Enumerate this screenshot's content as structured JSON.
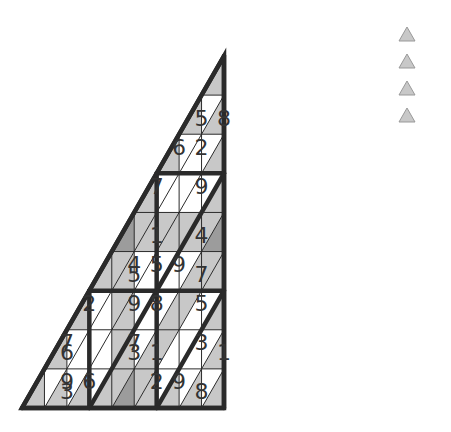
{
  "puzzle": {
    "type": "triangular-sudoku",
    "rows": 9,
    "geometry": {
      "apex_x": 224,
      "apex_y": 56,
      "base_y": 408,
      "base_left_x": 22,
      "base_right_x": 426
    },
    "colors": {
      "white": "#ffffff",
      "light": "#c8c8c8",
      "dark": "#9c9c9c",
      "line": "#2a2a2a",
      "text": "#333333"
    },
    "rows_data": [
      {
        "cells": [
          {
            "s": "L",
            "v": ""
          }
        ]
      },
      {
        "cells": [
          {
            "s": "L",
            "v": "5"
          },
          {
            "s": "W",
            "v": ""
          },
          {
            "s": "L",
            "v": "8"
          }
        ]
      },
      {
        "cells": [
          {
            "s": "L",
            "v": ""
          },
          {
            "s": "W",
            "v": "6"
          },
          {
            "s": "W",
            "v": ""
          },
          {
            "s": "W",
            "v": "2"
          },
          {
            "s": "L",
            "v": ""
          }
        ]
      },
      {
        "cells": [
          {
            "s": "L",
            "v": ""
          },
          {
            "s": "W",
            "v": "7"
          },
          {
            "s": "W",
            "v": ""
          },
          {
            "s": "W",
            "v": ""
          },
          {
            "s": "W",
            "v": ""
          },
          {
            "s": "W",
            "v": "9"
          },
          {
            "s": "L",
            "v": ""
          }
        ]
      },
      {
        "cells": [
          {
            "s": "D",
            "v": ""
          },
          {
            "s": "L",
            "v": ""
          },
          {
            "s": "L",
            "v": "1"
          },
          {
            "s": "L",
            "v": ""
          },
          {
            "s": "L",
            "v": ""
          },
          {
            "s": "L",
            "v": ""
          },
          {
            "s": "L",
            "v": "4"
          },
          {
            "s": "L",
            "v": ""
          },
          {
            "s": "D",
            "v": ""
          }
        ]
      },
      {
        "cells": [
          {
            "s": "L",
            "v": ""
          },
          {
            "s": "L",
            "v": ""
          },
          {
            "s": "L",
            "v": "5"
          },
          {
            "s": "W",
            "v": "4"
          },
          {
            "s": "W",
            "v": ""
          },
          {
            "s": "W",
            "v": "5"
          },
          {
            "s": "W",
            "v": ""
          },
          {
            "s": "W",
            "v": "9"
          },
          {
            "s": "L",
            "v": "7"
          },
          {
            "s": "L",
            "v": ""
          },
          {
            "s": "L",
            "v": ""
          }
        ]
      },
      {
        "cells": [
          {
            "s": "L",
            "v": ""
          },
          {
            "s": "W",
            "v": "2"
          },
          {
            "s": "W",
            "v": ""
          },
          {
            "s": "L",
            "v": ""
          },
          {
            "s": "L",
            "v": ""
          },
          {
            "s": "W",
            "v": "9"
          },
          {
            "s": "W",
            "v": ""
          },
          {
            "s": "W",
            "v": "8"
          },
          {
            "s": "L",
            "v": ""
          },
          {
            "s": "L",
            "v": ""
          },
          {
            "s": "W",
            "v": ""
          },
          {
            "s": "W",
            "v": "5"
          },
          {
            "s": "L",
            "v": ""
          }
        ]
      },
      {
        "cells": [
          {
            "s": "L",
            "v": "6"
          },
          {
            "s": "W",
            "v": "7"
          },
          {
            "s": "W",
            "v": ""
          },
          {
            "s": "W",
            "v": ""
          },
          {
            "s": "W",
            "v": ""
          },
          {
            "s": "L",
            "v": ""
          },
          {
            "s": "L",
            "v": "3"
          },
          {
            "s": "W",
            "v": "7"
          },
          {
            "s": "L",
            "v": "1"
          },
          {
            "s": "L",
            "v": ""
          },
          {
            "s": "W",
            "v": ""
          },
          {
            "s": "W",
            "v": ""
          },
          {
            "s": "W",
            "v": ""
          },
          {
            "s": "W",
            "v": "3"
          },
          {
            "s": "L",
            "v": "1"
          }
        ]
      },
      {
        "cells": [
          {
            "s": "L",
            "v": ""
          },
          {
            "s": "W",
            "v": ""
          },
          {
            "s": "L",
            "v": "3"
          },
          {
            "s": "W",
            "v": "9"
          },
          {
            "s": "L",
            "v": ""
          },
          {
            "s": "W",
            "v": "6"
          },
          {
            "s": "L",
            "v": ""
          },
          {
            "s": "L",
            "v": ""
          },
          {
            "s": "D",
            "v": ""
          },
          {
            "s": "L",
            "v": ""
          },
          {
            "s": "L",
            "v": ""
          },
          {
            "s": "W",
            "v": "2"
          },
          {
            "s": "L",
            "v": ""
          },
          {
            "s": "W",
            "v": "9"
          },
          {
            "s": "L",
            "v": "8"
          },
          {
            "s": "W",
            "v": ""
          },
          {
            "s": "L",
            "v": ""
          }
        ]
      }
    ]
  },
  "legend": {
    "items": [
      {
        "icon": "triangle-icon",
        "color": "#c8c8c8"
      },
      {
        "icon": "triangle-icon",
        "color": "#c8c8c8"
      },
      {
        "icon": "triangle-icon",
        "color": "#c8c8c8"
      },
      {
        "icon": "triangle-icon",
        "color": "#c8c8c8"
      }
    ]
  }
}
